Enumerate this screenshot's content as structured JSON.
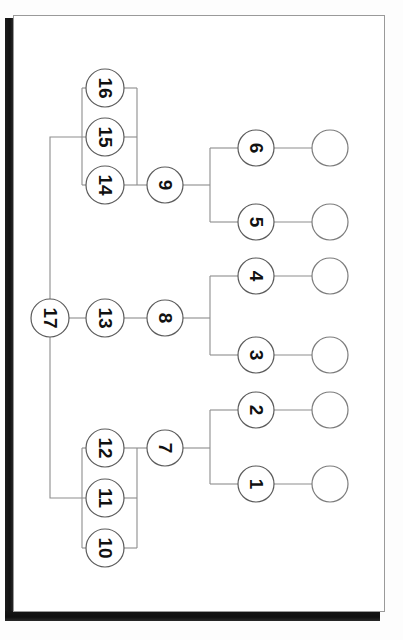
{
  "document": {
    "kind": "scanned-page",
    "figure_type": "phylogenetic-tree-diagram",
    "orientation": "rotated-90-ccw",
    "page_background": "#ffffff",
    "page_border_color": "#9a9a9a",
    "scan_shadow_color": "#151515",
    "edge_color": "#8d8d8d",
    "node_stroke_color": "#5c5c5c",
    "node_fill_color": "#ffffff",
    "label_color": "#111111"
  },
  "diagram": {
    "nodes": [
      {
        "id": "n1",
        "label": "1",
        "cx": 256,
        "cy": 484,
        "r": 18,
        "kind": "internal"
      },
      {
        "id": "n2",
        "label": "2",
        "cx": 256,
        "cy": 410,
        "r": 18,
        "kind": "internal"
      },
      {
        "id": "n3",
        "label": "3",
        "cx": 256,
        "cy": 355,
        "r": 18,
        "kind": "internal"
      },
      {
        "id": "n4",
        "label": "4",
        "cx": 256,
        "cy": 276,
        "r": 18,
        "kind": "internal"
      },
      {
        "id": "n5",
        "label": "5",
        "cx": 256,
        "cy": 222,
        "r": 18,
        "kind": "internal"
      },
      {
        "id": "n6",
        "label": "6",
        "cx": 256,
        "cy": 148,
        "r": 18,
        "kind": "internal"
      },
      {
        "id": "n7",
        "label": "7",
        "cx": 165,
        "cy": 448,
        "r": 18,
        "kind": "internal"
      },
      {
        "id": "n8",
        "label": "8",
        "cx": 165,
        "cy": 318,
        "r": 18,
        "kind": "internal"
      },
      {
        "id": "n9",
        "label": "9",
        "cx": 165,
        "cy": 185,
        "r": 18,
        "kind": "internal"
      },
      {
        "id": "n10",
        "label": "10",
        "cx": 105,
        "cy": 548,
        "r": 19,
        "kind": "internal"
      },
      {
        "id": "n11",
        "label": "11",
        "cx": 105,
        "cy": 498,
        "r": 19,
        "kind": "internal"
      },
      {
        "id": "n12",
        "label": "12",
        "cx": 105,
        "cy": 448,
        "r": 19,
        "kind": "internal"
      },
      {
        "id": "n13",
        "label": "13",
        "cx": 105,
        "cy": 318,
        "r": 19,
        "kind": "internal"
      },
      {
        "id": "n14",
        "label": "14",
        "cx": 105,
        "cy": 185,
        "r": 19,
        "kind": "internal"
      },
      {
        "id": "n15",
        "label": "15",
        "cx": 105,
        "cy": 137,
        "r": 19,
        "kind": "internal"
      },
      {
        "id": "n16",
        "label": "16",
        "cx": 105,
        "cy": 88,
        "r": 19,
        "kind": "internal"
      },
      {
        "id": "n17",
        "label": "17",
        "cx": 50,
        "cy": 318,
        "r": 19,
        "kind": "root"
      }
    ],
    "leaves": [
      {
        "id": "leaf6",
        "cx": 330,
        "cy": 148,
        "r": 18,
        "label": ""
      },
      {
        "id": "leaf5",
        "cx": 330,
        "cy": 222,
        "r": 18,
        "label": ""
      },
      {
        "id": "leaf4",
        "cx": 330,
        "cy": 276,
        "r": 18,
        "label": ""
      },
      {
        "id": "leaf3",
        "cx": 330,
        "cy": 355,
        "r": 18,
        "label": ""
      },
      {
        "id": "leaf2",
        "cx": 330,
        "cy": 410,
        "r": 18,
        "label": ""
      },
      {
        "id": "leaf1",
        "cx": 330,
        "cy": 484,
        "r": 18,
        "label": ""
      }
    ],
    "edges": [
      {
        "id": "e-root-up",
        "d": "M 50 299 L 50 137 L 86 137"
      },
      {
        "id": "e-root-down",
        "d": "M 50 337 L 50 498 L 86 498"
      },
      {
        "id": "e-root-13",
        "d": "M 69 318 L 86 318"
      },
      {
        "id": "e-13-8",
        "d": "M 124 318 L 147 318"
      },
      {
        "id": "e-8-bracket",
        "d": "M 183 318 L 210 318"
      },
      {
        "id": "e-br8",
        "d": "M 210 276 L 210 355"
      },
      {
        "id": "e-br8-4",
        "d": "M 210 276 L 238 276"
      },
      {
        "id": "e-br8-3",
        "d": "M 210 355 L 238 355"
      },
      {
        "id": "e-4-leaf",
        "d": "M 274 276 L 312 276"
      },
      {
        "id": "e-3-leaf",
        "d": "M 274 355 L 312 355"
      },
      {
        "id": "e-topL",
        "d": "M 82 88 L 82 185"
      },
      {
        "id": "e-topL-16",
        "d": "M 82 88 L 86 88"
      },
      {
        "id": "e-topL-14",
        "d": "M 82 185 L 86 185"
      },
      {
        "id": "e-topR",
        "d": "M 137 88 L 137 185"
      },
      {
        "id": "e-topR-16",
        "d": "M 124 88 L 137 88"
      },
      {
        "id": "e-topR-15",
        "d": "M 124 137 L 137 137"
      },
      {
        "id": "e-topR-14",
        "d": "M 124 185 L 137 185"
      },
      {
        "id": "e-14-9",
        "d": "M 137 185 L 147 185"
      },
      {
        "id": "e-9-bracket",
        "d": "M 183 185 L 210 185"
      },
      {
        "id": "e-br9",
        "d": "M 210 148 L 210 222"
      },
      {
        "id": "e-br9-6",
        "d": "M 210 148 L 238 148"
      },
      {
        "id": "e-br9-5",
        "d": "M 210 222 L 238 222"
      },
      {
        "id": "e-6-leaf",
        "d": "M 274 148 L 312 148"
      },
      {
        "id": "e-5-leaf",
        "d": "M 274 222 L 312 222"
      },
      {
        "id": "e-botL",
        "d": "M 82 448 L 82 548"
      },
      {
        "id": "e-botL-12",
        "d": "M 82 448 L 86 448"
      },
      {
        "id": "e-botL-10",
        "d": "M 82 548 L 86 548"
      },
      {
        "id": "e-botR",
        "d": "M 137 448 L 137 548"
      },
      {
        "id": "e-botR-12",
        "d": "M 124 448 L 137 448"
      },
      {
        "id": "e-botR-11",
        "d": "M 124 498 L 137 498"
      },
      {
        "id": "e-botR-10",
        "d": "M 124 548 L 137 548"
      },
      {
        "id": "e-12-7",
        "d": "M 137 448 L 147 448"
      },
      {
        "id": "e-7-bracket",
        "d": "M 183 448 L 210 448"
      },
      {
        "id": "e-br7",
        "d": "M 210 410 L 210 484"
      },
      {
        "id": "e-br7-2",
        "d": "M 210 410 L 238 410"
      },
      {
        "id": "e-br7-1",
        "d": "M 210 484 L 238 484"
      },
      {
        "id": "e-2-leaf",
        "d": "M 274 410 L 312 410"
      },
      {
        "id": "e-1-leaf",
        "d": "M 274 484 L 312 484"
      }
    ]
  }
}
